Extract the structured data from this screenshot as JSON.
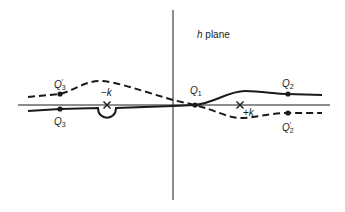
{
  "diagram": {
    "title_var": "h",
    "title_rest": " plane",
    "colors": {
      "line": "#1a1a1a",
      "background": "#ffffff"
    },
    "axes": {
      "horizontal": {
        "x1": 18,
        "y1": 105,
        "x2": 330,
        "y2": 105
      },
      "vertical": {
        "x1": 173,
        "y1": 10,
        "x2": 173,
        "y2": 200
      }
    },
    "poles": [
      {
        "id": "minus-k",
        "label_sign": "−",
        "label_var": "k",
        "x": 107,
        "y": 105
      },
      {
        "id": "plus-k",
        "label_sign": "+",
        "label_var": "k",
        "x": 240,
        "y": 105
      }
    ],
    "points": [
      {
        "id": "Q1",
        "letter": "Q",
        "sub": "1",
        "prime": "",
        "x": 195,
        "y": 105
      },
      {
        "id": "Q2",
        "letter": "Q",
        "sub": "2",
        "prime": "",
        "x": 288,
        "y": 94
      },
      {
        "id": "Q2p",
        "letter": "Q",
        "sub": "2",
        "prime": "′",
        "x": 288,
        "y": 113
      },
      {
        "id": "Q3",
        "letter": "Q",
        "sub": "3",
        "prime": "",
        "x": 60,
        "y": 109
      },
      {
        "id": "Q3p",
        "letter": "Q",
        "sub": "3",
        "prime": "′",
        "x": 60,
        "y": 94
      }
    ],
    "contours": [
      {
        "id": "solid-contour",
        "style": "solid",
        "path": "M28,111 L60,109 L98,108 C98,121 116,121 116,108 L173,106 L195,105 C215,103 228,91 245,91 C262,91 275,94 288,94 L322,95"
      },
      {
        "id": "dashed-contour",
        "style": "dashed",
        "path": "M28,97 L50,95 L60,94 C75,90 85,81 100,81 C115,81 145,92 173,100 L195,105 C215,110 228,118 240,118 C255,118 270,113 288,113 L322,113"
      }
    ]
  }
}
